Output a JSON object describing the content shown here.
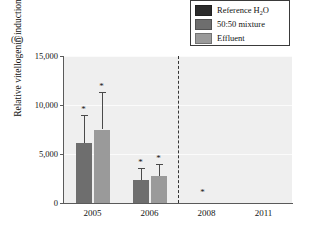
{
  "panel": {
    "label": "(C)"
  },
  "legend": {
    "position": "top-right",
    "items": [
      {
        "label": "Reference H",
        "sub": "2",
        "label_tail": "O",
        "color": "#2b2b2b",
        "name": "reference-water"
      },
      {
        "label": "50:50 mixture",
        "sub": "",
        "label_tail": "",
        "color": "#6e6e6e",
        "name": "fifty-fifty-mixture"
      },
      {
        "label": "Effluent",
        "sub": "",
        "label_tail": "",
        "color": "#9a9a9a",
        "name": "effluent"
      }
    ]
  },
  "chart_data": {
    "type": "bar",
    "title": "",
    "xlabel": "",
    "ylabel": "Relative vitellogenin induction",
    "categories": [
      "2005",
      "2006",
      "2008",
      "2011"
    ],
    "ylim": [
      0,
      15000
    ],
    "yticks": [
      0,
      5000,
      10000,
      15000
    ],
    "ytick_labels": [
      "0",
      "5,000",
      "10,000",
      "15,000"
    ],
    "grid": true,
    "legend_position": "upper right",
    "series": [
      {
        "name": "Reference H2O",
        "color": "#2b2b2b",
        "values": [
          null,
          null,
          null,
          null
        ],
        "errors": [
          null,
          null,
          null,
          null
        ]
      },
      {
        "name": "50:50 mixture",
        "color": "#6e6e6e",
        "values": [
          6100,
          2300,
          null,
          null
        ],
        "errors": [
          2900,
          1300,
          null,
          null
        ]
      },
      {
        "name": "Effluent",
        "color": "#9a9a9a",
        "values": [
          7500,
          2800,
          null,
          null
        ],
        "errors": [
          3800,
          1200,
          null,
          null
        ]
      }
    ],
    "annotations": [
      {
        "text": "*",
        "category": "2005",
        "series": "50:50 mixture",
        "note": "significant"
      },
      {
        "text": "*",
        "category": "2005",
        "series": "Effluent",
        "note": "significant"
      },
      {
        "text": "*",
        "category": "2006",
        "series": "50:50 mixture",
        "note": "significant"
      },
      {
        "text": "*",
        "category": "2006",
        "series": "Effluent",
        "note": "significant"
      },
      {
        "text": "*",
        "category": "2008",
        "series": "",
        "note": "lone asterisk near baseline"
      }
    ],
    "divider": {
      "type": "vertical-dashed",
      "between": [
        "2006",
        "2008"
      ]
    }
  },
  "colors": {
    "plot_background": "#efefef",
    "gridline": "#fbfbfb",
    "axis": "#5a5a5a",
    "error_bar": "#4a4a4a",
    "text": "#141414"
  }
}
